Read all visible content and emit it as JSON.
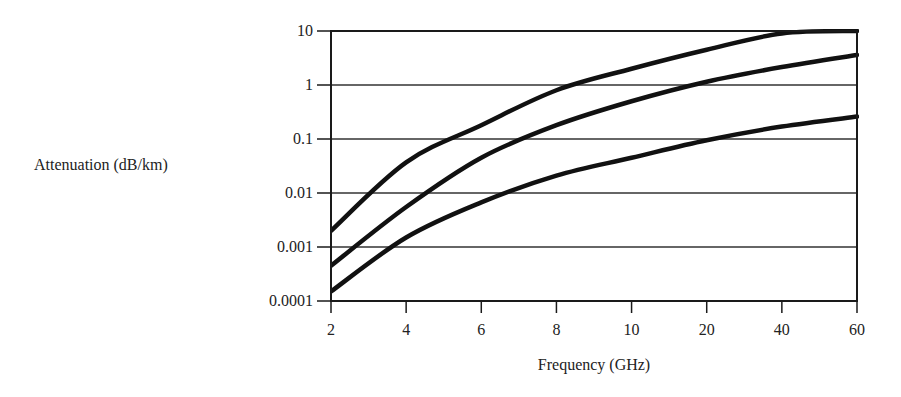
{
  "chart_data": {
    "type": "line",
    "title": "",
    "xlabel": "Frequency (GHz)",
    "ylabel": "Attenuation (dB/km)",
    "x_scale": "categorical-evenly-spaced",
    "y_scale": "log",
    "ylim": [
      0.0001,
      10
    ],
    "x": [
      2,
      4,
      6,
      8,
      10,
      20,
      40,
      60
    ],
    "x_tick_labels": [
      "2",
      "4",
      "6",
      "8",
      "10",
      "20",
      "40",
      "60"
    ],
    "y_tick_labels": [
      "10",
      "1",
      "0.1",
      "0.01",
      "0.001",
      "0.0001"
    ],
    "grid": "horizontal",
    "legend": "none",
    "series": [
      {
        "name": "Upper curve",
        "values": [
          0.002,
          0.037,
          0.18,
          0.8,
          2.0,
          4.5,
          9.0,
          10.0
        ],
        "note": "reaches top of axis (10) near ~50 GHz and is clipped"
      },
      {
        "name": "Middle curve",
        "values": [
          0.00045,
          0.0055,
          0.045,
          0.18,
          0.5,
          1.15,
          2.15,
          3.6
        ]
      },
      {
        "name": "Lower curve",
        "values": [
          0.00015,
          0.0015,
          0.0067,
          0.021,
          0.045,
          0.095,
          0.17,
          0.26
        ]
      }
    ],
    "colors": {
      "line": "#111111",
      "grid": "#333333",
      "background": "#ffffff"
    }
  },
  "labels": {
    "ylabel": "Attenuation (dB/km)",
    "xlabel": "Frequency (GHz)",
    "yticks": [
      "10",
      "1",
      "0.1",
      "0.01",
      "0.001",
      "0.0001"
    ],
    "xticks": [
      "2",
      "4",
      "6",
      "8",
      "10",
      "20",
      "40",
      "60"
    ]
  }
}
